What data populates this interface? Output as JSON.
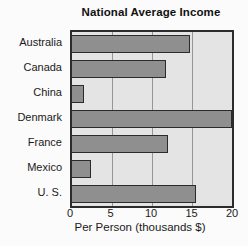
{
  "chart_data": {
    "type": "bar",
    "orientation": "horizontal",
    "title": "National Average Income",
    "xlabel": "Per Person (thousands $)",
    "ylabel": "",
    "categories": [
      "Australia",
      "Canada",
      "China",
      "Denmark",
      "France",
      "Mexico",
      "U. S."
    ],
    "values": [
      14.8,
      11.8,
      1.5,
      20,
      12,
      2.4,
      15.5
    ],
    "xlim": [
      0,
      20
    ],
    "xticks": [
      0,
      5,
      10,
      15,
      20
    ],
    "grid": true,
    "legend": false,
    "colors": {
      "bar_fill": "#8f8f8f",
      "bar_border": "#2b2b2b",
      "plot_background": "#e4e4e4",
      "gridline": "#969696",
      "text": "#1a1a1a"
    }
  }
}
